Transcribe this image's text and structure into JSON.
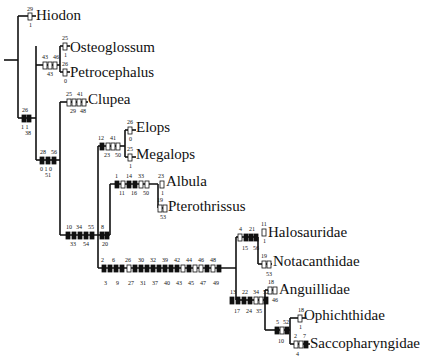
{
  "colors": {
    "line": "#111111",
    "background": "#ffffff",
    "filled": "#111111",
    "open": "#ffffff"
  },
  "taxa": [
    {
      "id": "hiodon",
      "label": "Hiodon",
      "x": 36,
      "y": 20
    },
    {
      "id": "osteoglossum",
      "label": "Osteoglossum",
      "x": 70,
      "y": 52
    },
    {
      "id": "petrocephalus",
      "label": "Petrocephalus",
      "x": 70,
      "y": 77
    },
    {
      "id": "clupea",
      "label": "Clupea",
      "x": 88,
      "y": 104
    },
    {
      "id": "elops",
      "label": "Elops",
      "x": 136,
      "y": 132
    },
    {
      "id": "megalops",
      "label": "Megalops",
      "x": 136,
      "y": 159
    },
    {
      "id": "albula",
      "label": "Albula",
      "x": 164,
      "y": 186
    },
    {
      "id": "pterothrissus",
      "label": "Pterothrissus",
      "x": 166,
      "y": 210
    },
    {
      "id": "halosauridae",
      "label": "Halosauridae",
      "x": 262,
      "y": 237
    },
    {
      "id": "notacanthidae",
      "label": "Notacanthidae",
      "x": 272,
      "y": 264
    },
    {
      "id": "anguillidae",
      "label": "Anguillidae",
      "x": 276,
      "y": 292
    },
    {
      "id": "ophichthidae",
      "label": "Ophichthidae",
      "x": 306,
      "y": 318
    },
    {
      "id": "saccopharyngidae",
      "label": "Saccopharyngidae",
      "x": 310,
      "y": 346
    }
  ],
  "branches": [
    {
      "name": "root",
      "marks": []
    },
    {
      "name": "hiodon",
      "marks": [
        {
          "char": "29",
          "state": "1",
          "type": "open"
        }
      ]
    },
    {
      "name": "osteoglossomorpha-rest",
      "marks": [
        {
          "char": "43",
          "state": "1",
          "type": "open"
        },
        {
          "char": "45",
          "state": "1",
          "type": "open"
        },
        {
          "char": "46",
          "state": "0",
          "type": "open"
        }
      ]
    },
    {
      "name": "osteoglossum",
      "marks": [
        {
          "char": "25",
          "state": "1",
          "type": "open"
        }
      ]
    },
    {
      "name": "petrocephalus",
      "marks": [
        {
          "char": "26",
          "state": "0",
          "type": "open"
        }
      ]
    },
    {
      "name": "clupeocephala",
      "marks": [
        {
          "char": "26",
          "state": "1",
          "type": "filled"
        },
        {
          "char": "38",
          "state": "1",
          "type": "filled"
        }
      ]
    },
    {
      "name": "clupea",
      "marks": [
        {
          "char": "25",
          "state": "1",
          "type": "open"
        },
        {
          "char": "29",
          "state": "1",
          "type": "open"
        },
        {
          "char": "41",
          "state": "1",
          "type": "open"
        },
        {
          "char": "48",
          "state": "1",
          "type": "open"
        }
      ]
    },
    {
      "name": "elopomorpha-plus",
      "marks": [
        {
          "char": "28",
          "state": "0",
          "type": "filled"
        },
        {
          "char": "51",
          "state": "1",
          "type": "filled"
        },
        {
          "char": "56",
          "state": "0",
          "type": "filled"
        }
      ]
    },
    {
      "name": "elopomorpha",
      "marks": [
        {
          "char": "10",
          "state": "1",
          "type": "filled"
        },
        {
          "char": "33",
          "state": "1",
          "type": "filled"
        },
        {
          "char": "34",
          "state": "1",
          "type": "filled"
        },
        {
          "char": "54",
          "state": "1",
          "type": "filled"
        },
        {
          "char": "55",
          "state": "1",
          "type": "filled"
        }
      ]
    },
    {
      "name": "elopiformes",
      "marks": [
        {
          "char": "12",
          "state": "1",
          "type": "filled"
        },
        {
          "char": "23",
          "state": "1",
          "type": "open"
        },
        {
          "char": "41",
          "state": "1",
          "type": "open"
        },
        {
          "char": "50",
          "state": "1",
          "type": "open"
        }
      ]
    },
    {
      "name": "elops",
      "marks": [
        {
          "char": "26",
          "state": "0",
          "type": "open"
        }
      ]
    },
    {
      "name": "megalops",
      "marks": [
        {
          "char": "25",
          "state": "1",
          "type": "open"
        }
      ]
    },
    {
      "name": "albuliformes-plus",
      "marks": [
        {
          "char": "8",
          "state": "1",
          "type": "filled"
        },
        {
          "char": "20",
          "state": "1",
          "type": "filled"
        }
      ]
    },
    {
      "name": "albuliformes",
      "marks": [
        {
          "char": "1",
          "state": "1",
          "type": "filled"
        },
        {
          "char": "11",
          "state": "1",
          "type": "open"
        },
        {
          "char": "14",
          "state": "1",
          "type": "filled"
        },
        {
          "char": "16",
          "state": "1",
          "type": "filled"
        },
        {
          "char": "33",
          "state": "0",
          "type": "open"
        },
        {
          "char": "50",
          "state": "1",
          "type": "open"
        }
      ]
    },
    {
      "name": "albula",
      "marks": [
        {
          "char": "23",
          "state": "1",
          "type": "open"
        }
      ]
    },
    {
      "name": "pterothrissus",
      "marks": [
        {
          "char": "19",
          "state": "1",
          "type": "open"
        },
        {
          "char": "53",
          "state": "1",
          "type": "open"
        }
      ]
    },
    {
      "name": "anguilliformes-plus",
      "marks": [
        {
          "char": "2",
          "state": "1",
          "type": "filled"
        },
        {
          "char": "3",
          "state": "0",
          "type": "filled"
        },
        {
          "char": "6",
          "state": "1",
          "type": "filled"
        },
        {
          "char": "9",
          "state": "0",
          "type": "filled"
        },
        {
          "char": "26",
          "state": "0",
          "type": "open"
        },
        {
          "char": "27",
          "state": "0",
          "type": "filled"
        },
        {
          "char": "30",
          "state": "0",
          "type": "filled"
        },
        {
          "char": "31",
          "state": "1",
          "type": "filled"
        },
        {
          "char": "32",
          "state": "0",
          "type": "filled"
        },
        {
          "char": "37",
          "state": "0",
          "type": "filled"
        },
        {
          "char": "39",
          "state": "1",
          "type": "filled"
        },
        {
          "char": "40",
          "state": "0",
          "type": "filled"
        },
        {
          "char": "42",
          "state": "1",
          "type": "filled"
        },
        {
          "char": "43",
          "state": "1",
          "type": "open"
        },
        {
          "char": "44",
          "state": "1",
          "type": "filled"
        },
        {
          "char": "45",
          "state": "1",
          "type": "open"
        },
        {
          "char": "46",
          "state": "0",
          "type": "open"
        },
        {
          "char": "47",
          "state": "0",
          "type": "filled"
        },
        {
          "char": "48",
          "state": "1",
          "type": "open"
        },
        {
          "char": "49",
          "state": "1",
          "type": "filled"
        }
      ]
    },
    {
      "name": "notacanthiformes",
      "marks": [
        {
          "char": "4",
          "state": "0",
          "type": "open"
        },
        {
          "char": "15",
          "state": "1",
          "type": "filled"
        },
        {
          "char": "21",
          "state": "1",
          "type": "filled"
        },
        {
          "char": "56",
          "state": "1",
          "type": "filled"
        }
      ]
    },
    {
      "name": "halosauridae",
      "marks": [
        {
          "char": "11",
          "state": "1",
          "type": "open"
        }
      ]
    },
    {
      "name": "notacanthidae",
      "marks": [
        {
          "char": "19",
          "state": "1",
          "type": "open"
        },
        {
          "char": "53",
          "state": "1",
          "type": "open"
        }
      ]
    },
    {
      "name": "anguilliformes",
      "marks": [
        {
          "char": "13",
          "state": "0",
          "type": "filled"
        },
        {
          "char": "17",
          "state": "1",
          "type": "filled"
        },
        {
          "char": "22",
          "state": "1",
          "type": "filled"
        },
        {
          "char": "24",
          "state": "0",
          "type": "filled"
        },
        {
          "char": "34",
          "state": "0",
          "type": "open"
        },
        {
          "char": "35",
          "state": "0",
          "type": "open"
        },
        {
          "char": "52",
          "state": "1",
          "type": "filled"
        }
      ]
    },
    {
      "name": "anguillidae",
      "marks": [
        {
          "char": "18",
          "state": "1",
          "type": "open"
        },
        {
          "char": "46",
          "state": "1",
          "type": "open"
        }
      ]
    },
    {
      "name": "ophichthid-sacco",
      "marks": [
        {
          "char": "5",
          "state": "1",
          "type": "filled"
        },
        {
          "char": "10",
          "state": "0",
          "type": "open"
        },
        {
          "char": "52",
          "state": "2",
          "type": "filled"
        }
      ]
    },
    {
      "name": "ophichthidae",
      "marks": [
        {
          "char": "18",
          "state": "1",
          "type": "open"
        }
      ]
    },
    {
      "name": "saccopharyngidae",
      "marks": [
        {
          "char": "2",
          "state": "0",
          "type": "open"
        },
        {
          "char": "4",
          "state": "0",
          "type": "open"
        },
        {
          "char": "7",
          "state": "0",
          "type": "filled"
        }
      ]
    }
  ]
}
